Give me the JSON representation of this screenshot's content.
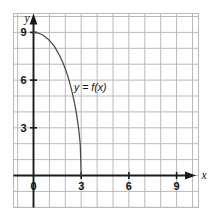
{
  "figure": {
    "axis_label_x": "x",
    "axis_label_y": "y",
    "curve_label": "y = f(x)",
    "colors": {
      "grid": "#b9b9b9",
      "axis": "#1a1a1a",
      "curve": "#4a4a4a",
      "text": "#111111",
      "background": "#ffffff"
    }
  },
  "chart_data": {
    "type": "line",
    "title": "",
    "xlabel": "x",
    "ylabel": "y",
    "xlim": [
      -1.2,
      11.1
    ],
    "ylim": [
      -1.8,
      11.0
    ],
    "grid": true,
    "grid_step": 1,
    "legend": "none",
    "annotations": [
      {
        "text": "y = f(x)",
        "x": 2.55,
        "y": 5.3
      }
    ],
    "xticks": [
      0,
      3,
      6,
      9
    ],
    "xtick_labels": [
      "0",
      "3",
      "6",
      "9"
    ],
    "yticks": [
      3,
      6,
      9
    ],
    "ytick_labels": [
      "3",
      "6",
      "9"
    ],
    "series": [
      {
        "name": "f(x)",
        "x": [
          0.0,
          0.15,
          0.3,
          0.45,
          0.6,
          0.75,
          0.9,
          1.05,
          1.2,
          1.35,
          1.5,
          1.65,
          1.8,
          1.95,
          2.1,
          2.25,
          2.4,
          2.55,
          2.7,
          2.85,
          2.94,
          3.0
        ],
        "y": [
          9.0,
          8.989,
          8.955,
          8.899,
          8.82,
          8.717,
          8.591,
          8.44,
          8.263,
          8.059,
          7.794,
          7.533,
          7.2,
          6.842,
          6.427,
          5.937,
          5.36,
          4.703,
          3.923,
          2.862,
          1.964,
          0.0
        ]
      }
    ]
  }
}
